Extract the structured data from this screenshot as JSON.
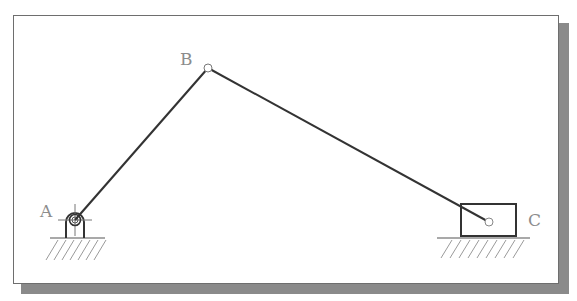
{
  "diagram": {
    "type": "slider-crank mechanism",
    "labels": {
      "A": "A",
      "B": "B",
      "C": "C"
    },
    "joints": {
      "A": {
        "x": 75,
        "y": 220,
        "kind": "fixed pivot"
      },
      "B": {
        "x": 208,
        "y": 68,
        "kind": "pin joint"
      },
      "C": {
        "x": 489,
        "y": 222,
        "kind": "slider pin"
      }
    },
    "links": [
      {
        "name": "crank",
        "from": "A",
        "to": "B"
      },
      {
        "name": "connecting-rod",
        "from": "B",
        "to": "C"
      }
    ],
    "colors": {
      "link": "#333333",
      "frame": "#6e6e6e",
      "shadow": "#8a8a8a",
      "label": "#8c8c8c",
      "hatch": "#9a9a9a"
    }
  }
}
